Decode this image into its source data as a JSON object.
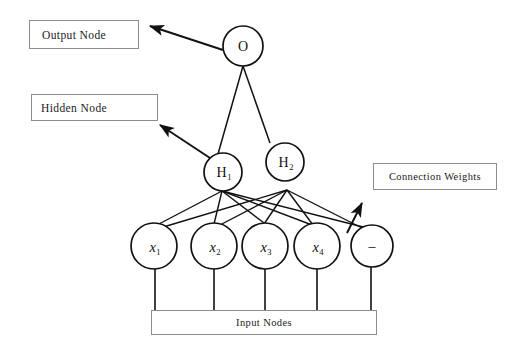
{
  "diagram": {
    "background_color": "#ffffff",
    "stroke_color": "#111111",
    "box_border_color": "#8d8d8d"
  },
  "callouts": [
    {
      "key": "output",
      "label": "Output  Node"
    },
    {
      "key": "hidden",
      "label": "Hidden  Node"
    },
    {
      "key": "weights",
      "label": "Connection  Weights"
    },
    {
      "key": "input",
      "label": "Input  Nodes"
    }
  ],
  "nodes": {
    "output": {
      "label_base": "O",
      "label_sub": "",
      "cx": 243,
      "cy": 46,
      "rx": 20,
      "ry": 20
    },
    "hidden": [
      {
        "label_base": "H",
        "label_sub": "1",
        "cx": 223,
        "cy": 172,
        "rx": 19,
        "ry": 19
      },
      {
        "label_base": "H",
        "label_sub": "2",
        "cx": 285,
        "cy": 162,
        "rx": 19,
        "ry": 19
      }
    ],
    "inputs": [
      {
        "label_base": "x",
        "label_sub": "1",
        "cx": 154,
        "cy": 246,
        "rx": 23,
        "ry": 23,
        "italic": true
      },
      {
        "label_base": "x",
        "label_sub": "2",
        "cx": 214,
        "cy": 246,
        "rx": 23,
        "ry": 23,
        "italic": true
      },
      {
        "label_base": "x",
        "label_sub": "3",
        "cx": 265,
        "cy": 246,
        "rx": 23,
        "ry": 23,
        "italic": true
      },
      {
        "label_base": "x",
        "label_sub": "4",
        "cx": 317,
        "cy": 246,
        "rx": 23,
        "ry": 23,
        "italic": true
      },
      {
        "label_base": "–",
        "label_sub": "",
        "cx": 372,
        "cy": 246,
        "rx": 21,
        "ry": 21,
        "italic": false
      }
    ]
  },
  "annotations": {
    "output_arrow": {
      "from_x": 223,
      "from_y": 50,
      "to_x": 147,
      "to_y": 26
    },
    "hidden_arrow": {
      "from_x": 210,
      "from_y": 158,
      "to_x": 157,
      "to_y": 124
    },
    "weights_arrow": {
      "from_x": 347,
      "from_y": 233,
      "to_x": 364,
      "to_y": 200
    }
  }
}
